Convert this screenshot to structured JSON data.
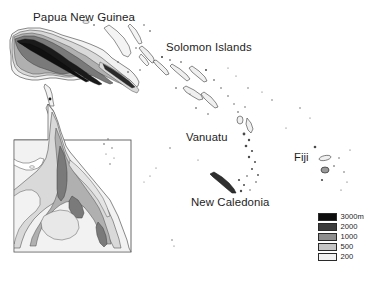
{
  "map": {
    "title": "Southwest Pacific relief map",
    "background_color": "#ffffff",
    "labels": [
      {
        "id": "papua-new-guinea",
        "text": "Papua New Guinea"
      },
      {
        "id": "solomon-islands",
        "text": "Solomon Islands"
      },
      {
        "id": "vanuatu",
        "text": "Vanuatu"
      },
      {
        "id": "new-caledonia",
        "text": "New Caledonia"
      },
      {
        "id": "fiji",
        "text": "Fiji"
      }
    ],
    "legend": {
      "name": "elevation-legend",
      "entries": [
        {
          "label": "3000m",
          "color": "#0d0d0d"
        },
        {
          "label": "2000",
          "color": "#3d3d3d"
        },
        {
          "label": "1000",
          "color": "#8e8e8e"
        },
        {
          "label": "500",
          "color": "#c6c6c6"
        },
        {
          "label": "200",
          "color": "#f2f2f2"
        }
      ]
    },
    "colors": {
      "outline": "#4a4a4a",
      "band_200": "#f2f2f2",
      "band_500": "#d9d9d9",
      "band_1000": "#b0b0b0",
      "band_2000": "#7a7a7a",
      "band_3000": "#1a1a1a",
      "inset_frame": "#5a5a5a",
      "text": "#1d1d1d"
    }
  }
}
